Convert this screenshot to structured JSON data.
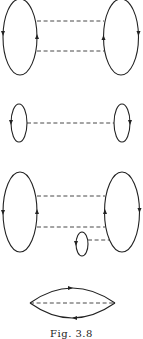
{
  "figure": {
    "caption": "Fig. 3.8",
    "diagrams": [
      {
        "id": 1,
        "description": "Two fermion loops connected by two dashed interaction lines"
      },
      {
        "id": 2,
        "description": "Two small fermion loops connected by one dashed interaction line"
      },
      {
        "id": 3,
        "description": "Two fermion loops connected by two dashed lines, plus a small tadpole loop attached by a dashed line to the right loop"
      },
      {
        "id": 4,
        "description": "Single lens-shaped fermion loop with internal dashed line"
      }
    ],
    "colors": {
      "line": "#222222",
      "background": "#ffffff"
    }
  }
}
